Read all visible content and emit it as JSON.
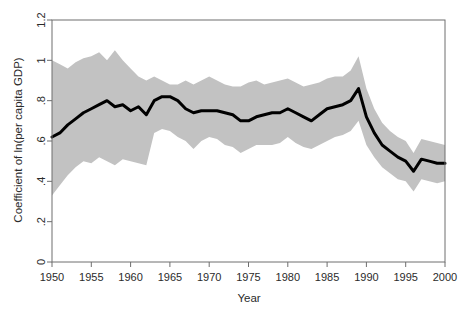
{
  "chart_data": {
    "type": "line",
    "title": "",
    "subtitle": "",
    "xlabel": "Year",
    "ylabel": "Coefficient of ln(per capita GDP)",
    "xlim": [
      1950,
      2000
    ],
    "ylim": [
      0,
      1.2
    ],
    "grid": false,
    "legend": null,
    "xticks": [
      1950,
      1955,
      1960,
      1965,
      1970,
      1975,
      1980,
      1985,
      1990,
      1995,
      2000
    ],
    "xticklabels": [
      "1950",
      "1955",
      "1960",
      "1965",
      "1970",
      "1975",
      "1980",
      "1985",
      "1990",
      "1995",
      "2000"
    ],
    "yticks": [
      0,
      0.2,
      0.4,
      0.6,
      0.8,
      1,
      1.2
    ],
    "yticklabels": [
      "0",
      ".2",
      ".4",
      ".6",
      ".8",
      "1",
      "1.2"
    ],
    "x": [
      1950,
      1951,
      1952,
      1953,
      1954,
      1955,
      1956,
      1957,
      1958,
      1959,
      1960,
      1961,
      1962,
      1963,
      1964,
      1965,
      1966,
      1967,
      1968,
      1969,
      1970,
      1971,
      1972,
      1973,
      1974,
      1975,
      1976,
      1977,
      1978,
      1979,
      1980,
      1981,
      1982,
      1983,
      1984,
      1985,
      1986,
      1987,
      1988,
      1989,
      1990,
      1991,
      1992,
      1993,
      1994,
      1995,
      1996,
      1997,
      1998,
      1999,
      2000
    ],
    "series": [
      {
        "name": "Coefficient of ln(per capita GDP)",
        "style": "solid-black-line",
        "values": [
          0.62,
          0.64,
          0.68,
          0.71,
          0.74,
          0.76,
          0.78,
          0.8,
          0.77,
          0.78,
          0.75,
          0.77,
          0.73,
          0.8,
          0.82,
          0.82,
          0.8,
          0.76,
          0.74,
          0.75,
          0.75,
          0.75,
          0.74,
          0.73,
          0.7,
          0.7,
          0.72,
          0.73,
          0.74,
          0.74,
          0.76,
          0.74,
          0.72,
          0.7,
          0.73,
          0.76,
          0.77,
          0.78,
          0.8,
          0.86,
          0.72,
          0.64,
          0.58,
          0.55,
          0.52,
          0.5,
          0.45,
          0.51,
          0.5,
          0.49,
          0.49
        ]
      }
    ],
    "confidence_band": {
      "name": "confidence interval",
      "fill_color": "#c2c2c2",
      "upper": [
        1.0,
        0.98,
        0.96,
        0.99,
        1.01,
        1.02,
        1.04,
        1.0,
        1.05,
        1.0,
        0.96,
        0.92,
        0.9,
        0.92,
        0.9,
        0.88,
        0.88,
        0.9,
        0.88,
        0.9,
        0.92,
        0.9,
        0.88,
        0.87,
        0.87,
        0.89,
        0.9,
        0.88,
        0.89,
        0.9,
        0.91,
        0.89,
        0.87,
        0.88,
        0.89,
        0.91,
        0.92,
        0.92,
        0.95,
        1.02,
        0.86,
        0.76,
        0.69,
        0.65,
        0.62,
        0.6,
        0.54,
        0.61,
        0.6,
        0.59,
        0.58
      ]
    },
    "confidence_band_lower": {
      "values": [
        0.33,
        0.38,
        0.43,
        0.47,
        0.5,
        0.49,
        0.52,
        0.5,
        0.48,
        0.51,
        0.5,
        0.49,
        0.48,
        0.64,
        0.66,
        0.65,
        0.62,
        0.6,
        0.56,
        0.6,
        0.62,
        0.61,
        0.58,
        0.57,
        0.54,
        0.56,
        0.58,
        0.58,
        0.58,
        0.59,
        0.62,
        0.59,
        0.57,
        0.56,
        0.58,
        0.6,
        0.62,
        0.63,
        0.65,
        0.7,
        0.58,
        0.52,
        0.47,
        0.44,
        0.41,
        0.4,
        0.35,
        0.41,
        0.4,
        0.39,
        0.4
      ]
    },
    "annotations": [],
    "colors": {
      "line": "#000000",
      "band": "#c2c2c2",
      "axis": "#6e6e6e",
      "text": "#2b2b2b",
      "background": "#ffffff"
    }
  }
}
